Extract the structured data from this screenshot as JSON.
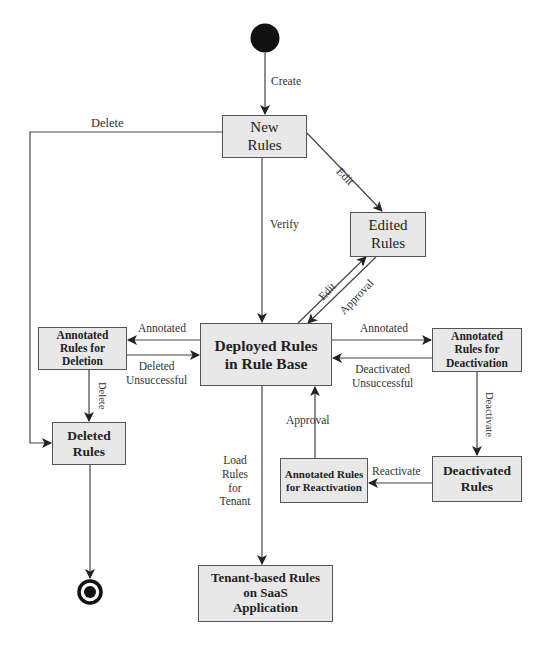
{
  "diagram": {
    "type": "state-machine",
    "start_node": "start-icon",
    "end_node": "end-icon",
    "states": {
      "new_rules": "New Rules",
      "edited_rules": "Edited Rules",
      "deployed": "Deployed Rules in Rule Base",
      "annot_deletion": "Annotated Rules for Deletion",
      "deleted": "Deleted Rules",
      "annot_deactivation": "Annotated Rules for Deactivation",
      "deactivated": "Deactivated Rules",
      "annot_reactivation": "Annotated Rules for Reactivation",
      "tenant": "Tenant-based Rules on SaaS Application"
    },
    "transitions": {
      "create": "Create",
      "delete_top": "Delete",
      "edit_new": "Edit",
      "verify": "Verify",
      "edit_back": "Edit",
      "approval_edited": "Approval",
      "annotated_left": "Annotated",
      "deleted_unsuccessful": "Deleted Unsuccessful",
      "annotated_right": "Annotated",
      "deactivated_unsuccessful": "Deactivated Unsuccessful",
      "delete_down": "Delete",
      "deactivate": "Deactivate",
      "reactivate": "Reactivate",
      "approval_reactivation": "Approval",
      "load_rules": "Load Rules for Tenant"
    }
  },
  "labels": {
    "new_rules_l1": "New",
    "new_rules_l2": "Rules",
    "edited_l1": "Edited",
    "edited_l2": "Rules",
    "deployed_l1": "Deployed Rules",
    "deployed_l2": "in Rule Base",
    "annot_del_l1": "Annotated",
    "annot_del_l2": "Rules for",
    "annot_del_l3": "Deletion",
    "deleted_l1": "Deleted",
    "deleted_l2": "Rules",
    "annot_deact_l1": "Annotated",
    "annot_deact_l2": "Rules for",
    "annot_deact_l3": "Deactivation",
    "deactivated_l1": "Deactivated",
    "deactivated_l2": "Rules",
    "annot_react_l1": "Annotated Rules",
    "annot_react_l2": "for Reactivation",
    "tenant_l1": "Tenant-based Rules",
    "tenant_l2": "on SaaS",
    "tenant_l3": "Application",
    "create": "Create",
    "delete_top": "Delete",
    "edit_new": "Edit",
    "verify": "Verify",
    "edit_back": "Edit",
    "approval_edited": "Approval",
    "annotated_left": "Annotated",
    "deleted_unsucc_l1": "Deleted",
    "deleted_unsucc_l2": "Unsuccessful",
    "annotated_right": "Annotated",
    "deact_unsucc_l1": "Deactivated",
    "deact_unsucc_l2": "Unsuccessful",
    "delete_down": "Delete",
    "deactivate": "Deactivate",
    "reactivate": "Reactivate",
    "approval_react": "Approval",
    "load_l1": "Load",
    "load_l2": "Rules",
    "load_l3": "for",
    "load_l4": "Tenant"
  },
  "colors": {
    "box_fill": "#e8e8e8",
    "box_border": "#555555",
    "line": "#444444",
    "node": "#111111"
  }
}
